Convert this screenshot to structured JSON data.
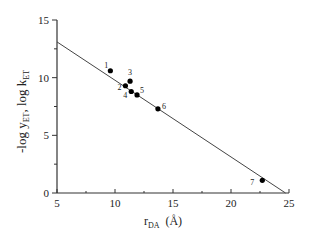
{
  "chart_data": {
    "type": "scatter",
    "title": "",
    "xlabel": "r_DA (Å)",
    "xlabel_main": "r",
    "xlabel_sub": "DA",
    "xlabel_unit": "(Å)",
    "ylabel": "-log y_ET, log k_ET",
    "xlim": [
      5,
      25
    ],
    "ylim": [
      0,
      15
    ],
    "x_ticks": [
      5,
      10,
      15,
      20,
      25
    ],
    "y_ticks": [
      0,
      5,
      10,
      15
    ],
    "grid": false,
    "legend": null,
    "points": [
      {
        "label": "1",
        "x": 9.6,
        "y": 10.6
      },
      {
        "label": "2",
        "x": 10.9,
        "y": 9.3
      },
      {
        "label": "3",
        "x": 11.3,
        "y": 9.7
      },
      {
        "label": "4",
        "x": 11.4,
        "y": 8.8
      },
      {
        "label": "5",
        "x": 11.9,
        "y": 8.5
      },
      {
        "label": "6",
        "x": 13.7,
        "y": 7.3
      },
      {
        "label": "7",
        "x": 22.7,
        "y": 1.1
      }
    ],
    "fit_line": {
      "x": [
        5,
        24.7
      ],
      "y": [
        13.1,
        0
      ]
    }
  }
}
